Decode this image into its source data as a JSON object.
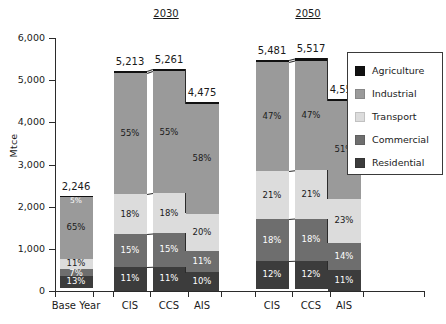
{
  "chart_data": {
    "type": "bar",
    "subtype": "stacked-bar-100-labelled",
    "title": "",
    "xlabel": "",
    "ylabel": "Mtce",
    "ylim": [
      0,
      6000
    ],
    "yticks": [
      0,
      1000,
      2000,
      3000,
      4000,
      5000,
      6000
    ],
    "ytick_labels": [
      "0",
      "1,000",
      "2,000",
      "3,000",
      "4,000",
      "5,000",
      "6,000"
    ],
    "grid": false,
    "legend_position": "right",
    "group_headers": [
      "2030",
      "2050"
    ],
    "categories": [
      "Base Year",
      "CIS",
      "CCS",
      "AIS",
      "CIS",
      "CCS",
      "AIS"
    ],
    "totals": [
      2246,
      5213,
      5261,
      4475,
      5481,
      5517,
      4558
    ],
    "total_labels": [
      "2,246",
      "5,213",
      "5,261",
      "4,475",
      "5,481",
      "5,517",
      "4,558"
    ],
    "series": [
      {
        "name": "Agriculture",
        "color": "#111111",
        "values": [
          1,
          1,
          1,
          1,
          1,
          1,
          1
        ],
        "labels": [
          "",
          "",
          "",
          "",
          "",
          "",
          ""
        ]
      },
      {
        "name": "Industrial",
        "color": "#9a9a9a",
        "values": [
          65,
          55,
          55,
          58,
          47,
          47,
          51
        ],
        "labels": [
          "65%",
          "55%",
          "55%",
          "58%",
          "47%",
          "47%",
          "51%"
        ]
      },
      {
        "name": "Transport",
        "color": "#dcdcdc",
        "values": [
          11,
          18,
          18,
          20,
          21,
          21,
          23
        ],
        "labels": [
          "11%",
          "18%",
          "18%",
          "20%",
          "21%",
          "21%",
          "23%"
        ]
      },
      {
        "name": "Commercial",
        "color": "#6e6e6e",
        "values": [
          7,
          15,
          15,
          11,
          18,
          18,
          14
        ],
        "labels": [
          "7%",
          "15%",
          "15%",
          "11%",
          "18%",
          "18%",
          "14%"
        ]
      },
      {
        "name": "Residential",
        "color": "#3c3c3c",
        "values": [
          13,
          11,
          11,
          10,
          12,
          12,
          11
        ],
        "labels": [
          "13%",
          "11%",
          "11%",
          "10%",
          "12%",
          "12%",
          "11%"
        ]
      }
    ],
    "base_year_extra_label": "5%",
    "annotations": []
  },
  "legend": {
    "items": [
      {
        "label": "Agriculture",
        "color": "#111111"
      },
      {
        "label": "Industrial",
        "color": "#9a9a9a"
      },
      {
        "label": "Transport",
        "color": "#dcdcdc"
      },
      {
        "label": "Commercial",
        "color": "#6e6e6e"
      },
      {
        "label": "Residential",
        "color": "#3c3c3c"
      }
    ]
  }
}
